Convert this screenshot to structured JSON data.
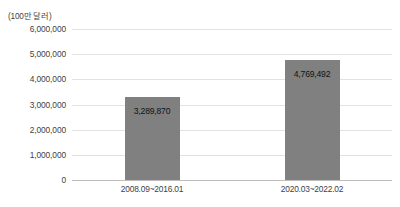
{
  "chart_data": {
    "type": "bar",
    "title": "",
    "subtitle": "",
    "unit_label": "(100만 달러)",
    "xlabel": "",
    "ylabel": "",
    "categories": [
      "2008.09~2016.01",
      "2020.03~2022.02"
    ],
    "values": [
      3289870,
      4769492
    ],
    "value_labels": [
      "3,289,870",
      "4,769,492"
    ],
    "ylim": [
      0,
      6000000
    ],
    "ytick_values": [
      0,
      1000000,
      2000000,
      3000000,
      4000000,
      5000000,
      6000000
    ],
    "ytick_labels": [
      "0",
      "1,000,000",
      "2,000,000",
      "3,000,000",
      "4,000,000",
      "5,000,000",
      "6,000,000"
    ],
    "grid": true,
    "legend": false,
    "legend_position": "none",
    "bar_color": "#808080",
    "gridline_color": "#e2e2e2",
    "axis_color": "#bdbdbd",
    "background_color": "#ffffff",
    "text_color": "#3f3f3f",
    "value_label_color": "#111111"
  }
}
